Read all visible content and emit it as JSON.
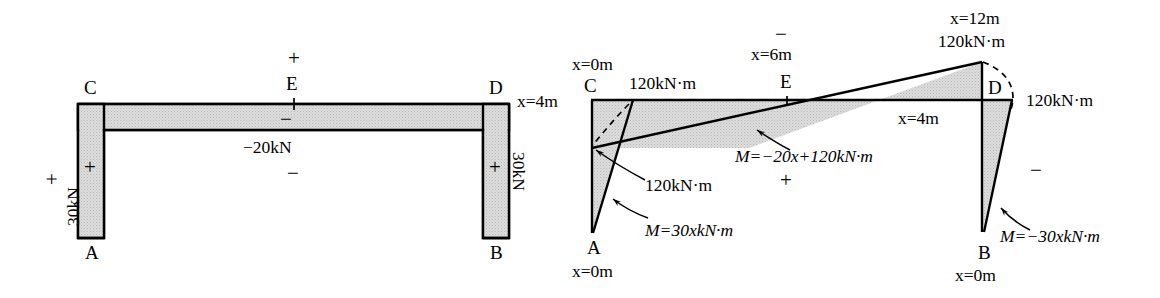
{
  "figure": {
    "title_hidden": "Shear force and bending moment diagrams for a portal frame",
    "colors": {
      "fill": "#d4d4d4",
      "stroke": "#000000",
      "background": "#ffffff"
    }
  },
  "left_diagram": {
    "name": "shear-force-diagram",
    "nodes": {
      "A": "A",
      "B": "B",
      "C": "C",
      "D": "D",
      "E": "E"
    },
    "labels": {
      "left_column_value": "30kN",
      "left_column_outer_sign": "+",
      "left_column_inner_sign": "+",
      "right_column_value": "30kN",
      "right_column_inner_sign": "+",
      "beam_value": "−20kN",
      "beam_top_sign": "+",
      "beam_inner_sign": "−",
      "beam_below_sign": "−"
    }
  },
  "right_diagram": {
    "name": "bending-moment-diagram",
    "nodes": {
      "A": "A",
      "B": "B",
      "C": "C",
      "D": "D",
      "E": "E"
    },
    "labels": {
      "x_at_C": "x=0m",
      "x_at_A": "x=0m",
      "x_at_B": "x=0m",
      "x_left_of_C": "x=4m",
      "x_right_near_D": "x=4m",
      "x_at_E": "x=6m",
      "x_at_top_D": "x=12m",
      "moment_top_C": "120kN·m",
      "moment_top_D": "120kN·m",
      "moment_right_D": "120kN·m",
      "moment_callout_C": "120kN·m",
      "eq_column_A": "M=30xkN·m",
      "eq_beam": "M=−20x+120kN·m",
      "eq_column_B": "M=−30xkN·m",
      "sign_above_E": "−",
      "sign_below_beam": "+",
      "sign_right_B": "−"
    }
  }
}
